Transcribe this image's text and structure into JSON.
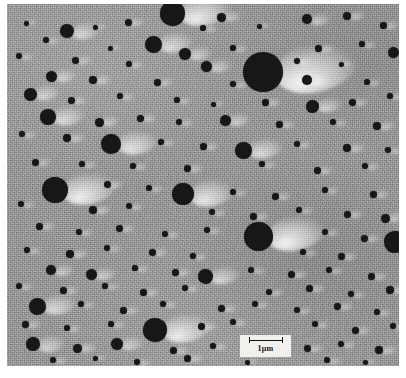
{
  "figure": {
    "kind": "electron-micrograph",
    "plate": {
      "background_color": "#9b9b9b",
      "particle_color": "#171717",
      "shadow_highlight_color": "#ffffff",
      "border_color": "#ffffff",
      "x": 7,
      "y": 4,
      "width": 392,
      "height": 362
    },
    "scale_bar": {
      "label": "1μm",
      "value": "1",
      "unit": "μm",
      "bar_length_px": 34,
      "box_color": "#f2f0ec",
      "ink_color": "#141414",
      "x": 240,
      "y": 335,
      "width": 51,
      "height": 22
    }
  },
  "chart_data": {
    "type": "scatter",
    "xlabel": "",
    "ylabel": "",
    "xlim": [
      0,
      392
    ],
    "ylim": [
      0,
      362
    ],
    "grid": false,
    "legend": null,
    "annotations": [
      "1μm"
    ],
    "series": [
      {
        "name": "particles",
        "note": "x, y are plate-relative pixel centres; d is particle diameter in px",
        "points": [
          {
            "x": 165,
            "y": 9,
            "d": 25
          },
          {
            "x": 60,
            "y": 27,
            "d": 14
          },
          {
            "x": 300,
            "y": 15,
            "d": 10
          },
          {
            "x": 214,
            "y": 13,
            "d": 9
          },
          {
            "x": 340,
            "y": 12,
            "d": 8
          },
          {
            "x": 121,
            "y": 18,
            "d": 7
          },
          {
            "x": 19,
            "y": 19,
            "d": 5
          },
          {
            "x": 88,
            "y": 23,
            "d": 5
          },
          {
            "x": 196,
            "y": 24,
            "d": 6
          },
          {
            "x": 252,
            "y": 22,
            "d": 5
          },
          {
            "x": 376,
            "y": 21,
            "d": 7
          },
          {
            "x": 39,
            "y": 36,
            "d": 6
          },
          {
            "x": 146,
            "y": 40,
            "d": 17
          },
          {
            "x": 256,
            "y": 68,
            "d": 40
          },
          {
            "x": 103,
            "y": 44,
            "d": 5
          },
          {
            "x": 178,
            "y": 50,
            "d": 12
          },
          {
            "x": 226,
            "y": 44,
            "d": 6
          },
          {
            "x": 311,
            "y": 44,
            "d": 7
          },
          {
            "x": 355,
            "y": 40,
            "d": 6
          },
          {
            "x": 386,
            "y": 48,
            "d": 11
          },
          {
            "x": 12,
            "y": 52,
            "d": 6
          },
          {
            "x": 68,
            "y": 56,
            "d": 7
          },
          {
            "x": 122,
            "y": 60,
            "d": 6
          },
          {
            "x": 199,
            "y": 62,
            "d": 11
          },
          {
            "x": 290,
            "y": 57,
            "d": 6
          },
          {
            "x": 334,
            "y": 60,
            "d": 5
          },
          {
            "x": 44,
            "y": 72,
            "d": 11
          },
          {
            "x": 86,
            "y": 76,
            "d": 8
          },
          {
            "x": 150,
            "y": 78,
            "d": 7
          },
          {
            "x": 226,
            "y": 80,
            "d": 6
          },
          {
            "x": 300,
            "y": 76,
            "d": 10
          },
          {
            "x": 360,
            "y": 78,
            "d": 6
          },
          {
            "x": 23,
            "y": 90,
            "d": 13
          },
          {
            "x": 64,
            "y": 96,
            "d": 7
          },
          {
            "x": 113,
            "y": 92,
            "d": 6
          },
          {
            "x": 170,
            "y": 96,
            "d": 6
          },
          {
            "x": 206,
            "y": 100,
            "d": 5
          },
          {
            "x": 258,
            "y": 98,
            "d": 7
          },
          {
            "x": 305,
            "y": 102,
            "d": 13
          },
          {
            "x": 345,
            "y": 98,
            "d": 7
          },
          {
            "x": 383,
            "y": 92,
            "d": 6
          },
          {
            "x": 41,
            "y": 113,
            "d": 16
          },
          {
            "x": 92,
            "y": 118,
            "d": 9
          },
          {
            "x": 133,
            "y": 114,
            "d": 7
          },
          {
            "x": 172,
            "y": 118,
            "d": 6
          },
          {
            "x": 218,
            "y": 116,
            "d": 11
          },
          {
            "x": 272,
            "y": 120,
            "d": 7
          },
          {
            "x": 326,
            "y": 118,
            "d": 6
          },
          {
            "x": 370,
            "y": 122,
            "d": 8
          },
          {
            "x": 15,
            "y": 130,
            "d": 6
          },
          {
            "x": 60,
            "y": 134,
            "d": 8
          },
          {
            "x": 104,
            "y": 140,
            "d": 20
          },
          {
            "x": 154,
            "y": 138,
            "d": 6
          },
          {
            "x": 196,
            "y": 142,
            "d": 7
          },
          {
            "x": 236,
            "y": 146,
            "d": 17
          },
          {
            "x": 290,
            "y": 140,
            "d": 6
          },
          {
            "x": 340,
            "y": 144,
            "d": 8
          },
          {
            "x": 381,
            "y": 146,
            "d": 6
          },
          {
            "x": 28,
            "y": 158,
            "d": 7
          },
          {
            "x": 75,
            "y": 160,
            "d": 6
          },
          {
            "x": 126,
            "y": 162,
            "d": 6
          },
          {
            "x": 180,
            "y": 164,
            "d": 7
          },
          {
            "x": 255,
            "y": 160,
            "d": 6
          },
          {
            "x": 310,
            "y": 166,
            "d": 7
          },
          {
            "x": 358,
            "y": 162,
            "d": 6
          },
          {
            "x": 48,
            "y": 186,
            "d": 26
          },
          {
            "x": 100,
            "y": 180,
            "d": 7
          },
          {
            "x": 142,
            "y": 184,
            "d": 6
          },
          {
            "x": 176,
            "y": 190,
            "d": 22
          },
          {
            "x": 226,
            "y": 188,
            "d": 6
          },
          {
            "x": 268,
            "y": 192,
            "d": 7
          },
          {
            "x": 318,
            "y": 186,
            "d": 6
          },
          {
            "x": 366,
            "y": 190,
            "d": 7
          },
          {
            "x": 14,
            "y": 200,
            "d": 6
          },
          {
            "x": 86,
            "y": 206,
            "d": 8
          },
          {
            "x": 122,
            "y": 202,
            "d": 6
          },
          {
            "x": 205,
            "y": 208,
            "d": 6
          },
          {
            "x": 246,
            "y": 212,
            "d": 7
          },
          {
            "x": 292,
            "y": 206,
            "d": 6
          },
          {
            "x": 340,
            "y": 210,
            "d": 7
          },
          {
            "x": 378,
            "y": 214,
            "d": 9
          },
          {
            "x": 32,
            "y": 222,
            "d": 7
          },
          {
            "x": 72,
            "y": 228,
            "d": 6
          },
          {
            "x": 112,
            "y": 224,
            "d": 7
          },
          {
            "x": 158,
            "y": 230,
            "d": 6
          },
          {
            "x": 200,
            "y": 226,
            "d": 6
          },
          {
            "x": 251,
            "y": 232,
            "d": 29
          },
          {
            "x": 318,
            "y": 228,
            "d": 6
          },
          {
            "x": 357,
            "y": 234,
            "d": 7
          },
          {
            "x": 388,
            "y": 238,
            "d": 22
          },
          {
            "x": 20,
            "y": 246,
            "d": 6
          },
          {
            "x": 63,
            "y": 250,
            "d": 8
          },
          {
            "x": 100,
            "y": 244,
            "d": 6
          },
          {
            "x": 145,
            "y": 248,
            "d": 7
          },
          {
            "x": 186,
            "y": 252,
            "d": 6
          },
          {
            "x": 296,
            "y": 248,
            "d": 6
          },
          {
            "x": 334,
            "y": 252,
            "d": 7
          },
          {
            "x": 44,
            "y": 266,
            "d": 10
          },
          {
            "x": 84,
            "y": 270,
            "d": 11
          },
          {
            "x": 128,
            "y": 264,
            "d": 6
          },
          {
            "x": 168,
            "y": 268,
            "d": 7
          },
          {
            "x": 198,
            "y": 272,
            "d": 15
          },
          {
            "x": 244,
            "y": 266,
            "d": 6
          },
          {
            "x": 284,
            "y": 270,
            "d": 7
          },
          {
            "x": 322,
            "y": 266,
            "d": 6
          },
          {
            "x": 364,
            "y": 272,
            "d": 7
          },
          {
            "x": 12,
            "y": 282,
            "d": 6
          },
          {
            "x": 56,
            "y": 286,
            "d": 7
          },
          {
            "x": 98,
            "y": 282,
            "d": 6
          },
          {
            "x": 136,
            "y": 288,
            "d": 7
          },
          {
            "x": 178,
            "y": 284,
            "d": 6
          },
          {
            "x": 262,
            "y": 288,
            "d": 6
          },
          {
            "x": 302,
            "y": 284,
            "d": 7
          },
          {
            "x": 344,
            "y": 290,
            "d": 6
          },
          {
            "x": 383,
            "y": 286,
            "d": 8
          },
          {
            "x": 30,
            "y": 302,
            "d": 17
          },
          {
            "x": 74,
            "y": 300,
            "d": 6
          },
          {
            "x": 116,
            "y": 306,
            "d": 7
          },
          {
            "x": 156,
            "y": 300,
            "d": 6
          },
          {
            "x": 214,
            "y": 304,
            "d": 7
          },
          {
            "x": 248,
            "y": 300,
            "d": 6
          },
          {
            "x": 290,
            "y": 306,
            "d": 6
          },
          {
            "x": 330,
            "y": 302,
            "d": 7
          },
          {
            "x": 370,
            "y": 308,
            "d": 6
          },
          {
            "x": 18,
            "y": 320,
            "d": 7
          },
          {
            "x": 60,
            "y": 324,
            "d": 6
          },
          {
            "x": 104,
            "y": 320,
            "d": 6
          },
          {
            "x": 148,
            "y": 326,
            "d": 24
          },
          {
            "x": 194,
            "y": 322,
            "d": 7
          },
          {
            "x": 226,
            "y": 318,
            "d": 6
          },
          {
            "x": 308,
            "y": 320,
            "d": 6
          },
          {
            "x": 348,
            "y": 326,
            "d": 7
          },
          {
            "x": 386,
            "y": 322,
            "d": 6
          },
          {
            "x": 26,
            "y": 340,
            "d": 14
          },
          {
            "x": 70,
            "y": 344,
            "d": 9
          },
          {
            "x": 110,
            "y": 340,
            "d": 12
          },
          {
            "x": 166,
            "y": 346,
            "d": 7
          },
          {
            "x": 206,
            "y": 342,
            "d": 6
          },
          {
            "x": 300,
            "y": 344,
            "d": 7
          },
          {
            "x": 334,
            "y": 340,
            "d": 6
          },
          {
            "x": 372,
            "y": 346,
            "d": 8
          },
          {
            "x": 46,
            "y": 356,
            "d": 6
          },
          {
            "x": 88,
            "y": 354,
            "d": 5
          },
          {
            "x": 130,
            "y": 358,
            "d": 6
          },
          {
            "x": 180,
            "y": 354,
            "d": 7
          },
          {
            "x": 240,
            "y": 358,
            "d": 5
          },
          {
            "x": 320,
            "y": 356,
            "d": 6
          },
          {
            "x": 358,
            "y": 358,
            "d": 5
          }
        ]
      }
    ]
  }
}
